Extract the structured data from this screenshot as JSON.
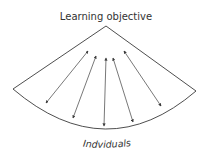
{
  "diagram": {
    "top_label": "Learning objective",
    "bottom_label": "Indviduals",
    "colors": {
      "stroke": "#3a3a3a",
      "text": "#333333",
      "background": "#ffffff"
    },
    "shape": "sector (fan) with apex at top",
    "arrows": [
      {
        "from": "left-bottom",
        "to": "top",
        "bidirectional": true
      },
      {
        "from": "left-center-bottom",
        "to": "top",
        "bidirectional": true
      },
      {
        "from": "center-bottom",
        "to": "top",
        "bidirectional": true
      },
      {
        "from": "right-center-bottom",
        "to": "top",
        "bidirectional": true
      },
      {
        "from": "right-bottom",
        "to": "top",
        "bidirectional": true
      }
    ]
  }
}
